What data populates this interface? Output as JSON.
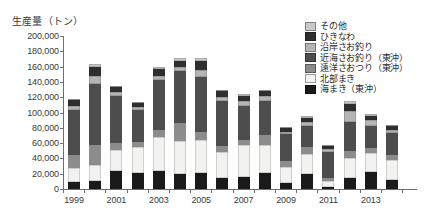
{
  "chart_data": {
    "type": "bar",
    "title": "生産量（トン）",
    "xlabel": "",
    "ylabel": "生産量（トン）",
    "ylim": [
      0,
      200000
    ],
    "ytick_step": 20000,
    "grid": false,
    "stacked": true,
    "legend_position": "top-right",
    "ytick_labels": [
      "200,000",
      "180,000",
      "160,000",
      "140,000",
      "120,000",
      "100,000",
      "80,000",
      "60,000",
      "40,000",
      "20,000",
      "0"
    ],
    "categories": [
      1999,
      2000,
      2001,
      2002,
      2003,
      2004,
      2005,
      2006,
      2007,
      2008,
      2009,
      2010,
      2011,
      2012,
      2013,
      2014
    ],
    "xtick_labels": [
      "1999",
      "2001",
      "2003",
      "2005",
      "2007",
      "2009",
      "2011",
      "2013"
    ],
    "series": [
      {
        "name": "海まき（東沖）",
        "color": "#1a1a1a",
        "values": [
          9000,
          11000,
          23000,
          21000,
          23000,
          20000,
          21000,
          14000,
          16000,
          21000,
          8000,
          20000,
          2000,
          14000,
          22000,
          12000
        ]
      },
      {
        "name": "北部まき",
        "color": "#f2f2f0",
        "values": [
          19000,
          21000,
          28000,
          34000,
          45000,
          43000,
          43000,
          34000,
          42000,
          36000,
          21000,
          26000,
          8000,
          27000,
          25000,
          26000
        ]
      },
      {
        "name": "遠洋さおつり（東沖）",
        "color": "#8c8c8c",
        "values": [
          17000,
          26000,
          9000,
          7000,
          9000,
          23000,
          11000,
          8000,
          6000,
          13000,
          7000,
          9000,
          5000,
          9000,
          6000,
          6000
        ]
      },
      {
        "name": "近海さお釣り（東沖）",
        "color": "#4d4d4d",
        "values": [
          58000,
          79000,
          62000,
          41000,
          66000,
          68000,
          72000,
          59000,
          45000,
          45000,
          36000,
          28000,
          34000,
          38000,
          30000,
          29000
        ]
      },
      {
        "name": "沿岸さお釣り",
        "color": "#b5b5b5",
        "values": [
          5000,
          11000,
          5000,
          4000,
          5000,
          6000,
          9000,
          5000,
          6000,
          6000,
          3000,
          5000,
          3000,
          14000,
          7000,
          4000
        ]
      },
      {
        "name": "ひきなわ",
        "color": "#2e2e2e",
        "values": [
          8000,
          12000,
          6000,
          5000,
          9000,
          8000,
          12000,
          8000,
          7000,
          7000,
          5000,
          5000,
          4000,
          9000,
          6000,
          5000
        ]
      },
      {
        "name": "その他",
        "color": "#c9c9c9",
        "values": [
          2000,
          3000,
          2000,
          2000,
          3000,
          3000,
          3000,
          2000,
          2000,
          2000,
          1000,
          2000,
          1000,
          4000,
          2000,
          2000
        ]
      }
    ],
    "totals": [
      118000,
      163000,
      135000,
      114000,
      160000,
      171000,
      171000,
      130000,
      124000,
      130000,
      81000,
      95000,
      57000,
      115000,
      98000,
      84000
    ]
  },
  "legend": {
    "items": [
      {
        "label": "その他"
      },
      {
        "label": "ひきなわ"
      },
      {
        "label": "沿岸さお釣り"
      },
      {
        "label": "近海さお釣り（東沖）"
      },
      {
        "label": "遠洋さおつり（東沖）"
      },
      {
        "label": "北部まき"
      },
      {
        "label": "海まき（東沖）"
      }
    ]
  },
  "colors": {
    "axis": "#6e6e6e",
    "text": "#2b2b2b",
    "background": "#ffffff"
  }
}
